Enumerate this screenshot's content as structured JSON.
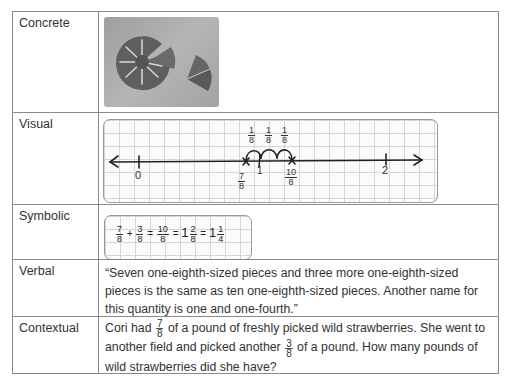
{
  "rows": [
    {
      "label": "Concrete",
      "content_type": "photo",
      "photo_alt": "fraction circle pieces: a circle of eighths with pieces removed and three eighth-pieces set apart"
    },
    {
      "label": "Visual",
      "content_type": "number_line"
    },
    {
      "label": "Symbolic",
      "content_type": "equation"
    },
    {
      "label": "Verbal",
      "content_type": "text"
    },
    {
      "label": "Contextual",
      "content_type": "word_problem"
    }
  ],
  "visual": {
    "ticks": [
      {
        "label": "0",
        "value": 0
      },
      {
        "label": "1",
        "value": 1
      },
      {
        "label": "2",
        "value": 2
      }
    ],
    "marks": [
      {
        "num": "7",
        "den": "8",
        "value": 0.875
      },
      {
        "num": "10",
        "den": "8",
        "value": 1.25
      }
    ],
    "jumps": [
      {
        "num": "1",
        "den": "8"
      },
      {
        "num": "1",
        "den": "8"
      },
      {
        "num": "1",
        "den": "8"
      }
    ]
  },
  "symbolic": {
    "terms": [
      {
        "whole": "",
        "num": "7",
        "den": "8"
      },
      {
        "op": "+"
      },
      {
        "whole": "",
        "num": "3",
        "den": "8"
      },
      {
        "op": "="
      },
      {
        "whole": "",
        "num": "10",
        "den": "8"
      },
      {
        "op": "="
      },
      {
        "whole": "1",
        "num": "2",
        "den": "8"
      },
      {
        "op": "="
      },
      {
        "whole": "1",
        "num": "1",
        "den": "4"
      }
    ]
  },
  "verbal": {
    "text": "“Seven one-eighth-sized pieces and three more one-eighth-sized pieces is the same as ten one-eighth-sized pieces. Another name for this quantity is one and one-fourth.”"
  },
  "contextual": {
    "part1": "Cori had",
    "frac1": {
      "num": "7",
      "den": "8"
    },
    "part2": "of a pound of freshly picked wild strawberries. She went to another field and picked another",
    "frac2": {
      "num": "3",
      "den": "8"
    },
    "part3": "of a pound. How many pounds of wild strawberries did she have?"
  }
}
